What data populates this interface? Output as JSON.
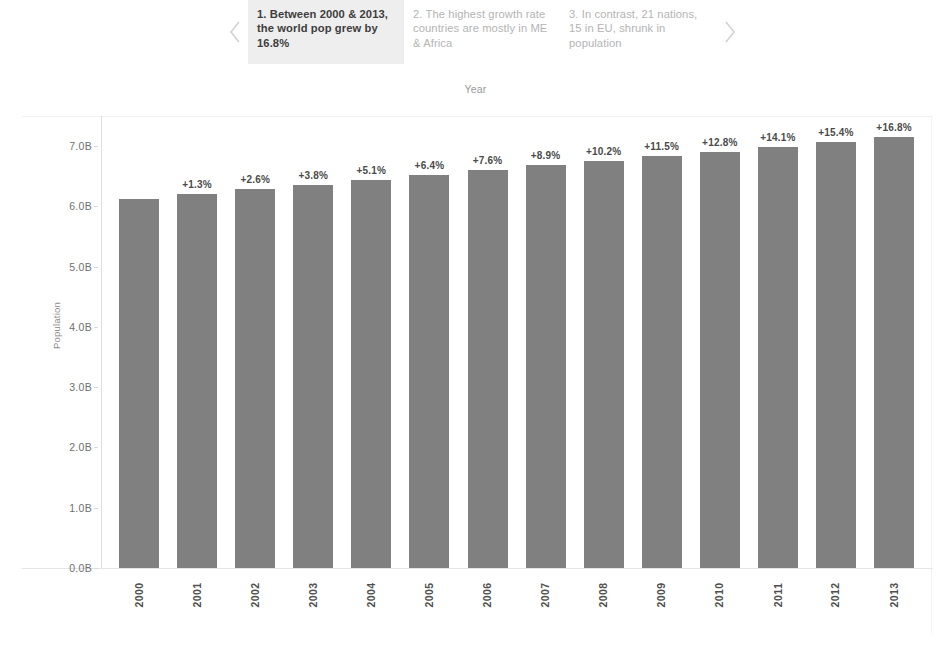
{
  "carousel": {
    "prev_icon": "chevron-left-icon",
    "next_icon": "chevron-right-icon",
    "cards": [
      {
        "text": "1. Between 2000 & 2013, the world pop grew by 16.8%",
        "active": true
      },
      {
        "text": "2. The highest growth rate countries are mostly in ME & Africa",
        "active": false
      },
      {
        "text": "3. In contrast, 21 nations, 15 in EU, shrunk in population",
        "active": false
      }
    ],
    "active_background": "#eeeeee",
    "active_text_color": "#3d3d3d",
    "inactive_text_color": "#b4b4b4"
  },
  "chart_data": {
    "type": "bar",
    "title": "Year",
    "xlabel": "Year",
    "ylabel": "Population",
    "categories": [
      "2000",
      "2001",
      "2002",
      "2003",
      "2004",
      "2005",
      "2006",
      "2007",
      "2008",
      "2009",
      "2010",
      "2011",
      "2012",
      "2013"
    ],
    "values": [
      6.13,
      6.21,
      6.29,
      6.36,
      6.44,
      6.52,
      6.6,
      6.68,
      6.75,
      6.83,
      6.91,
      6.99,
      7.07,
      7.16
    ],
    "value_unit": "B",
    "data_labels": [
      "",
      "+1.3%",
      "+2.6%",
      "+3.8%",
      "+5.1%",
      "+6.4%",
      "+7.6%",
      "+8.9%",
      "+10.2%",
      "+11.5%",
      "+12.8%",
      "+14.1%",
      "+15.4%",
      "+16.8%"
    ],
    "ylim": [
      0,
      7.5
    ],
    "yticks": [
      0,
      1,
      2,
      3,
      4,
      5,
      6,
      7
    ],
    "ytick_labels": [
      "0.0B",
      "1.0B",
      "2.0B",
      "3.0B",
      "4.0B",
      "5.0B",
      "6.0B",
      "7.0B"
    ],
    "grid": false,
    "legend": false,
    "bar_color": "#808080",
    "axis_color": "#dedede"
  }
}
